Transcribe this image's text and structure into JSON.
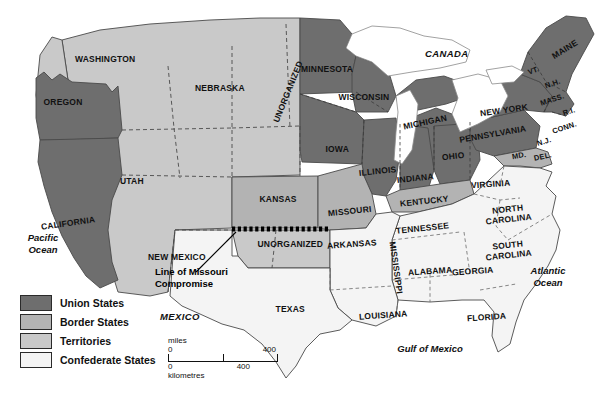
{
  "map": {
    "title": "United States during the Civil War — Union, Border, Territories, Confederate",
    "colors": {
      "union": "#6e6e6e",
      "border": "#b3b3b3",
      "territory": "#c9c9c9",
      "confederate": "#f0f0f0",
      "water": "#ffffff",
      "outline": "#4a4a4a",
      "compromise_line": "#000000"
    }
  },
  "legend": {
    "items": [
      {
        "label": "Union States",
        "swatch": "#6e6e6e"
      },
      {
        "label": "Border States",
        "swatch": "#b3b3b3"
      },
      {
        "label": "Territories",
        "swatch": "#c9c9c9"
      },
      {
        "label": "Confederate States",
        "swatch": "#f4f4f4"
      }
    ]
  },
  "scale": {
    "miles_label": "miles",
    "kilometres_label": "kilometres",
    "miles_start": "0",
    "miles_end": "400",
    "km_start": "0",
    "km_mid": "400"
  },
  "annotation": {
    "missouri_compromise": "Line of Missouri\nCompromise",
    "line1": "Line of Missouri",
    "line2": "Compromise"
  },
  "oceans": [
    {
      "name": "pacific",
      "line1": "Pacific",
      "line2": "Ocean"
    },
    {
      "name": "atlantic",
      "line1": "Atlantic",
      "line2": "Ocean"
    },
    {
      "name": "gulf",
      "line1": "Gulf of Mexico",
      "line2": ""
    }
  ],
  "countries": [
    {
      "name": "canada",
      "label": "CANADA"
    },
    {
      "name": "mexico",
      "label": "MEXICO"
    }
  ],
  "states": [
    {
      "id": "washington",
      "label": "WASHINGTON",
      "category": "territory",
      "x": 105,
      "y": 60,
      "size": 8.5,
      "rot": 0
    },
    {
      "id": "oregon",
      "label": "OREGON",
      "category": "union",
      "x": 63,
      "y": 103,
      "size": 8.5,
      "rot": 0
    },
    {
      "id": "california",
      "label": "CALIFORNIA",
      "category": "union",
      "x": 68,
      "y": 224,
      "size": 8.5,
      "rot": -8
    },
    {
      "id": "utah",
      "label": "UTAH",
      "category": "territory",
      "x": 132,
      "y": 182,
      "size": 8.5,
      "rot": 0
    },
    {
      "id": "new-mexico",
      "label": "NEW MEXICO",
      "category": "territory",
      "x": 177,
      "y": 258,
      "size": 8.5,
      "rot": 0
    },
    {
      "id": "nebraska",
      "label": "NEBRASKA",
      "category": "territory",
      "x": 220,
      "y": 89,
      "size": 8.5,
      "rot": 0
    },
    {
      "id": "unorganized-n",
      "label": "UNORGANIZED",
      "category": "territory",
      "x": 288,
      "y": 92,
      "size": 8.5,
      "rot": -68
    },
    {
      "id": "minnesota",
      "label": "MINNESOTA",
      "category": "union",
      "x": 327,
      "y": 70,
      "size": 8.5,
      "rot": 0
    },
    {
      "id": "wisconsin",
      "label": "WISCONSIN",
      "category": "union",
      "x": 364,
      "y": 98,
      "size": 8.5,
      "rot": 0
    },
    {
      "id": "michigan",
      "label": "MICHIGAN",
      "category": "union",
      "x": 425,
      "y": 123,
      "size": 8.5,
      "rot": -12
    },
    {
      "id": "iowa",
      "label": "IOWA",
      "category": "union",
      "x": 337,
      "y": 150,
      "size": 8.5,
      "rot": 0
    },
    {
      "id": "illinois",
      "label": "ILLINOIS",
      "category": "union",
      "x": 378,
      "y": 172,
      "size": 8.5,
      "rot": -6
    },
    {
      "id": "indiana",
      "label": "INDIANA",
      "category": "union",
      "x": 415,
      "y": 179,
      "size": 8.5,
      "rot": -6
    },
    {
      "id": "ohio",
      "label": "OHIO",
      "category": "union",
      "x": 453,
      "y": 157,
      "size": 8.5,
      "rot": -6
    },
    {
      "id": "kansas",
      "label": "KANSAS",
      "category": "border",
      "x": 278,
      "y": 200,
      "size": 8.5,
      "rot": 0
    },
    {
      "id": "missouri",
      "label": "MISSOURI",
      "category": "border",
      "x": 350,
      "y": 212,
      "size": 8.5,
      "rot": -6
    },
    {
      "id": "kentucky",
      "label": "KENTUCKY",
      "category": "border",
      "x": 424,
      "y": 202,
      "size": 8.5,
      "rot": -6
    },
    {
      "id": "unorganized-s",
      "label": "UNORGANIZED",
      "category": "territory",
      "x": 290,
      "y": 245,
      "size": 8.5,
      "rot": 0
    },
    {
      "id": "arkansas",
      "label": "ARKANSAS",
      "category": "confederate",
      "x": 352,
      "y": 245,
      "size": 8.5,
      "rot": -4
    },
    {
      "id": "tennessee",
      "label": "TENNESSEE",
      "category": "confederate",
      "x": 422,
      "y": 229,
      "size": 8.5,
      "rot": -6
    },
    {
      "id": "mississippi",
      "label": "MISSISSIPPI",
      "category": "confederate",
      "x": 395,
      "y": 268,
      "size": 8.5,
      "rot": 82
    },
    {
      "id": "alabama",
      "label": "ALABAMA",
      "category": "confederate",
      "x": 430,
      "y": 272,
      "size": 8.5,
      "rot": -4
    },
    {
      "id": "georgia",
      "label": "GEORGIA",
      "category": "confederate",
      "x": 473,
      "y": 272,
      "size": 8.5,
      "rot": -4
    },
    {
      "id": "florida",
      "label": "FLORIDA",
      "category": "confederate",
      "x": 486,
      "y": 318,
      "size": 8.5,
      "rot": -4
    },
    {
      "id": "louisiana",
      "label": "LOUISIANA",
      "category": "confederate",
      "x": 383,
      "y": 316,
      "size": 8.5,
      "rot": -4
    },
    {
      "id": "texas",
      "label": "TEXAS",
      "category": "confederate",
      "x": 290,
      "y": 310,
      "size": 8.5,
      "rot": 0
    },
    {
      "id": "virginia",
      "label": "VIRGINIA",
      "category": "confederate",
      "x": 490,
      "y": 185,
      "size": 8.5,
      "rot": -4
    },
    {
      "id": "north-carolina",
      "label": "NORTH\nCAROLINA",
      "category": "confederate",
      "x": 508,
      "y": 215,
      "size": 8.5,
      "rot": -6
    },
    {
      "id": "south-carolina",
      "label": "SOUTH\nCAROLINA",
      "category": "confederate",
      "x": 508,
      "y": 251,
      "size": 8.5,
      "rot": -6
    },
    {
      "id": "maryland",
      "label": "MD.",
      "category": "border",
      "x": 519,
      "y": 156,
      "size": 7.5,
      "rot": -10
    },
    {
      "id": "delaware",
      "label": "DEL.",
      "category": "border",
      "x": 543,
      "y": 157,
      "size": 7.5,
      "rot": -12
    },
    {
      "id": "new-jersey",
      "label": "N.J.",
      "category": "union",
      "x": 544,
      "y": 142,
      "size": 7.5,
      "rot": -16
    },
    {
      "id": "pennsylvania",
      "label": "PENNSYLVANIA",
      "category": "union",
      "x": 493,
      "y": 135,
      "size": 8.5,
      "rot": -10
    },
    {
      "id": "new-york",
      "label": "NEW YORK",
      "category": "union",
      "x": 504,
      "y": 111,
      "size": 8.5,
      "rot": -8
    },
    {
      "id": "connecticut",
      "label": "CONN.",
      "category": "union",
      "x": 564,
      "y": 128,
      "size": 7.5,
      "rot": -18
    },
    {
      "id": "rhode-island",
      "label": "R.I.",
      "category": "union",
      "x": 569,
      "y": 112,
      "size": 7.5,
      "rot": -18
    },
    {
      "id": "massachusetts",
      "label": "MASS.",
      "category": "union",
      "x": 552,
      "y": 100,
      "size": 7.5,
      "rot": -18
    },
    {
      "id": "new-hampshire",
      "label": "N.H.",
      "category": "union",
      "x": 553,
      "y": 84,
      "size": 7.5,
      "rot": -20
    },
    {
      "id": "vermont",
      "label": "VT.",
      "category": "union",
      "x": 533,
      "y": 71,
      "size": 7.5,
      "rot": -20
    },
    {
      "id": "maine",
      "label": "MAINE",
      "category": "union",
      "x": 565,
      "y": 50,
      "size": 8.5,
      "rot": -32
    }
  ]
}
